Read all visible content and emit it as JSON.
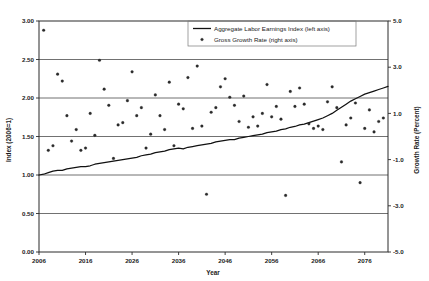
{
  "chart_data": {
    "type": "scatter",
    "title": "",
    "xlabel": "Year",
    "ylabel": "Index (2006=1)",
    "y2label": "Growth Rate (Percent)",
    "xlim": [
      2006,
      2081
    ],
    "ylim": [
      0.0,
      3.0
    ],
    "y2lim": [
      -5.0,
      5.0
    ],
    "grid": true,
    "legend_position": "top-center",
    "x_ticks": [
      "2006",
      "2016",
      "2026",
      "2036",
      "2046",
      "2056",
      "2066",
      "2076"
    ],
    "x_tick_values": [
      2006,
      2016,
      2026,
      2036,
      2046,
      2056,
      2066,
      2076
    ],
    "y_ticks": [
      "0.00",
      "0.50",
      "1.00",
      "1.50",
      "2.00",
      "2.50",
      "3.00"
    ],
    "y_tick_values": [
      0.0,
      0.5,
      1.0,
      1.5,
      2.0,
      2.5,
      3.0
    ],
    "y2_ticks": [
      "-5.0",
      "-3.0",
      "-1.0",
      "1.0",
      "3.0",
      "5.0"
    ],
    "y2_tick_values": [
      -5.0,
      -3.0,
      -1.0,
      1.0,
      3.0,
      5.0
    ],
    "series": [
      {
        "name": "Aggregate Labor Earnings Index (left axis)",
        "type": "line",
        "axis": "left",
        "x": [
          2006,
          2007,
          2008,
          2009,
          2010,
          2011,
          2012,
          2013,
          2014,
          2015,
          2016,
          2017,
          2018,
          2019,
          2020,
          2021,
          2022,
          2023,
          2024,
          2025,
          2026,
          2027,
          2028,
          2029,
          2030,
          2031,
          2032,
          2033,
          2034,
          2035,
          2036,
          2037,
          2038,
          2039,
          2040,
          2041,
          2042,
          2043,
          2044,
          2045,
          2046,
          2047,
          2048,
          2049,
          2050,
          2051,
          2052,
          2053,
          2054,
          2055,
          2056,
          2057,
          2058,
          2059,
          2060,
          2061,
          2062,
          2063,
          2064,
          2065,
          2066,
          2067,
          2068,
          2069,
          2070,
          2071,
          2072,
          2073,
          2074,
          2075,
          2076,
          2077,
          2078,
          2079,
          2080,
          2081
        ],
        "values": [
          1.0,
          1.01,
          1.03,
          1.05,
          1.06,
          1.06,
          1.08,
          1.09,
          1.1,
          1.11,
          1.11,
          1.12,
          1.14,
          1.15,
          1.16,
          1.17,
          1.18,
          1.19,
          1.2,
          1.21,
          1.22,
          1.23,
          1.25,
          1.26,
          1.27,
          1.29,
          1.3,
          1.31,
          1.33,
          1.34,
          1.35,
          1.34,
          1.36,
          1.37,
          1.38,
          1.39,
          1.4,
          1.41,
          1.43,
          1.44,
          1.45,
          1.46,
          1.46,
          1.48,
          1.49,
          1.5,
          1.51,
          1.52,
          1.53,
          1.55,
          1.56,
          1.57,
          1.59,
          1.6,
          1.62,
          1.63,
          1.65,
          1.66,
          1.68,
          1.7,
          1.72,
          1.74,
          1.77,
          1.8,
          1.84,
          1.88,
          1.92,
          1.96,
          1.99,
          2.02,
          2.05,
          2.07,
          2.09,
          2.11,
          2.13,
          2.15
        ]
      },
      {
        "name": "Gross Growth Rate (right axis)",
        "type": "scatter",
        "axis": "right",
        "x": [
          2007,
          2008,
          2009,
          2010,
          2011,
          2012,
          2013,
          2014,
          2015,
          2016,
          2017,
          2018,
          2019,
          2020,
          2021,
          2022,
          2023,
          2024,
          2025,
          2026,
          2027,
          2028,
          2029,
          2030,
          2031,
          2032,
          2033,
          2034,
          2035,
          2036,
          2037,
          2038,
          2039,
          2040,
          2041,
          2042,
          2043,
          2044,
          2045,
          2046,
          2047,
          2048,
          2049,
          2050,
          2051,
          2052,
          2053,
          2054,
          2055,
          2056,
          2057,
          2058,
          2059,
          2060,
          2061,
          2062,
          2063,
          2064,
          2065,
          2066,
          2067,
          2068,
          2069,
          2070,
          2071,
          2072,
          2073,
          2074,
          2075,
          2076,
          2077,
          2078,
          2079,
          2080
        ],
        "values": [
          4.6,
          -0.6,
          -0.4,
          2.7,
          2.4,
          0.9,
          -0.2,
          0.3,
          -0.6,
          -0.5,
          1.0,
          0.05,
          3.3,
          2.05,
          1.35,
          -0.95,
          0.5,
          0.6,
          1.55,
          2.8,
          0.9,
          1.25,
          -0.5,
          0.1,
          1.8,
          0.9,
          0.3,
          2.35,
          -0.4,
          1.4,
          1.2,
          2.55,
          0.35,
          3.05,
          0.45,
          -2.5,
          1.05,
          1.25,
          2.15,
          2.5,
          1.7,
          1.35,
          0.65,
          1.75,
          0.4,
          0.85,
          0.45,
          1.0,
          2.25,
          0.85,
          1.3,
          0.75,
          -2.55,
          1.95,
          1.3,
          2.1,
          1.4,
          0.55,
          0.35,
          0.45,
          0.3,
          1.5,
          2.15,
          1.25,
          -1.1,
          0.5,
          0.8,
          1.45,
          -2.0,
          0.35,
          1.15,
          0.2,
          0.65,
          0.8
        ]
      }
    ]
  },
  "legend": {
    "entries": [
      {
        "label": "Aggregate Labor Earnings Index (left axis)",
        "marker": "line"
      },
      {
        "label": "Gross Growth Rate (right axis)",
        "marker": "point"
      }
    ]
  }
}
